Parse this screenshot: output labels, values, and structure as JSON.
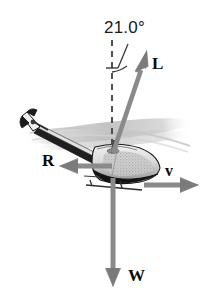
{
  "figure": {
    "kind": "free-body-force-diagram",
    "background_color": "#ffffff",
    "width": 212,
    "height": 303
  },
  "angle": {
    "value": "21.0",
    "unit_symbol": "°",
    "text": "21.0°",
    "measured_from": "vertical-dashed-reference-line",
    "measured_to": "lift-vector-L"
  },
  "vectors": [
    {
      "id": "L",
      "label": "L",
      "meaning": "lift",
      "color": "#8a8a8a",
      "direction": "up-and-to-the-right",
      "angle_from_vertical_deg": 21.0,
      "origin": {
        "x": 113,
        "y": 153
      },
      "tip": {
        "x": 147,
        "y": 51
      }
    },
    {
      "id": "R",
      "label": "R",
      "meaning": "air-resistance-drag",
      "color": "#8a8a8a",
      "direction": "left",
      "origin": {
        "x": 112,
        "y": 166
      },
      "tip": {
        "x": 59,
        "y": 166
      }
    },
    {
      "id": "v",
      "label": "v",
      "meaning": "velocity",
      "color": "#8a8a8a",
      "direction": "right",
      "origin": {
        "x": 144,
        "y": 185
      },
      "tip": {
        "x": 199,
        "y": 185
      }
    },
    {
      "id": "W",
      "label": "W",
      "meaning": "weight",
      "color": "#8a8a8a",
      "direction": "down",
      "origin": {
        "x": 113,
        "y": 180
      },
      "tip": {
        "x": 113,
        "y": 287
      }
    }
  ],
  "reference_line": {
    "id": "vertical-dashed",
    "style": "dashed",
    "color": "#4a4a4a",
    "from": {
      "x": 112,
      "y": 40
    },
    "to": {
      "x": 112,
      "y": 153
    }
  },
  "colors": {
    "vector_gray": "#8a8a8a",
    "vector_gray_dark": "#6f6f6f",
    "label_black": "#0a0a0a",
    "dash_gray": "#4a4a4a",
    "rotor_blur": "#d8d8d8",
    "body_outline": "#1c1c1c",
    "body_fill": "#e6e6e6",
    "body_shade": "#9a9a9a"
  }
}
